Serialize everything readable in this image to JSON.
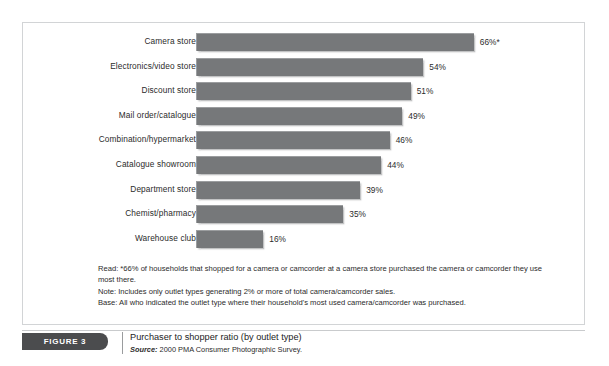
{
  "figure": {
    "badge_label": "FIGURE 3",
    "title": "Purchaser to shopper ratio (by outlet type)",
    "source_prefix": "Source:",
    "source_text": " 2000 PMA Consumer Photographic Survey."
  },
  "notes": {
    "read": "Read: *66% of households that shopped for a camera or camcorder at a camera store purchased the camera or camcorder they use most there.",
    "note": "Note: Includes only outlet types generating 2% or more of total camera/camcorder sales.",
    "base": "Base: All who indicated the outlet type where their household's most used camera/camcorder was purchased."
  },
  "colors": {
    "bar_fill": "#76787a",
    "bar_edge": "#9b9d9f",
    "badge_bg": "#4b4c4e",
    "panel_border": "#d2d4d6",
    "text": "#2b2b2b"
  },
  "chart_data": {
    "type": "bar",
    "orientation": "horizontal",
    "title": "Purchaser to shopper ratio (by outlet type)",
    "xlabel": "",
    "ylabel": "",
    "xlim": [
      0,
      70
    ],
    "grid": false,
    "legend": null,
    "value_suffix": "%",
    "categories": [
      "Camera store",
      "Electronics/video store",
      "Discount store",
      "Mail order/catalogue",
      "Combination/hypermarket",
      "Catalogue showroom",
      "Department store",
      "Chemist/pharmacy",
      "Warehouse club"
    ],
    "values": [
      66,
      54,
      51,
      49,
      46,
      44,
      39,
      35,
      16
    ],
    "value_labels": [
      "66%*",
      "54%",
      "51%",
      "49%",
      "46%",
      "44%",
      "39%",
      "35%",
      "16%"
    ],
    "annotations": [
      "* see Read note: 66% of households that shopped at a camera store purchased there"
    ]
  }
}
